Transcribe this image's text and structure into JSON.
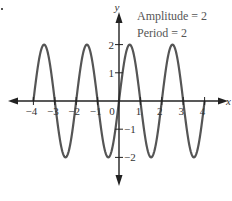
{
  "chart_data": {
    "type": "line",
    "title": "",
    "function": "y = 2 sin(pi x)",
    "annotations": [
      "Amplitude = 2",
      "Period = 2"
    ],
    "xlabel": "x",
    "ylabel": "y",
    "xlim": [
      -4,
      4
    ],
    "ylim": [
      -2,
      2
    ],
    "x_ticks": [
      -4,
      -3,
      -2,
      -1,
      0,
      1,
      2,
      3,
      4
    ],
    "x_tick_labels": [
      "−4",
      "−3",
      "−2",
      "−1",
      "0",
      "1",
      "2",
      "3",
      "4"
    ],
    "y_ticks": [
      -2,
      -1,
      1,
      2
    ],
    "y_tick_labels": [
      "−2",
      "−1",
      "1",
      "2"
    ],
    "grid": false,
    "series": [
      {
        "name": "y = 2 sin(pi x)",
        "color": "#555555",
        "x": [
          -4,
          -3.5,
          -3,
          -2.5,
          -2,
          -1.5,
          -1,
          -0.5,
          0,
          0.5,
          1,
          1.5,
          2,
          2.5,
          3,
          3.5,
          4
        ],
        "values": [
          0,
          2,
          0,
          -2,
          0,
          2,
          0,
          -2,
          0,
          2,
          0,
          -2,
          0,
          2,
          0,
          -2,
          0
        ]
      }
    ]
  },
  "annotation": {
    "amplitude": "Amplitude = 2",
    "period": "Period = 2"
  }
}
